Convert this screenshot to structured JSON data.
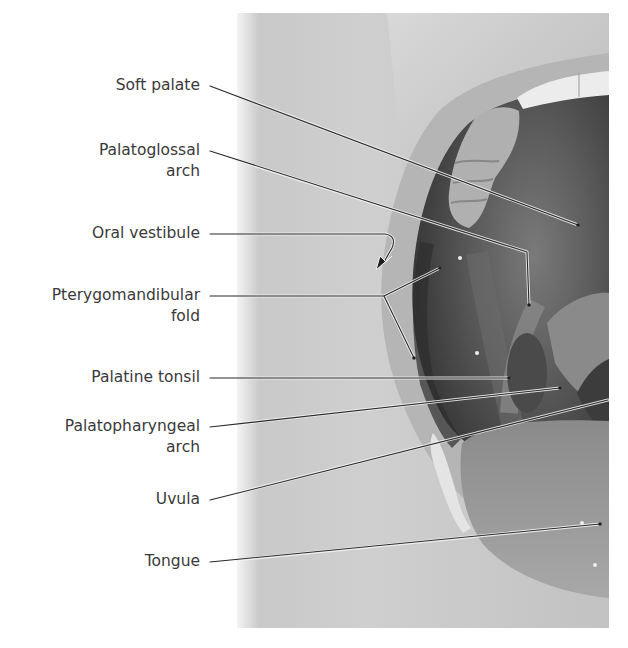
{
  "figure": {
    "type": "labeled anatomical photograph",
    "colors": {
      "text": "#3a3a3a",
      "leader_dark": "#2a2a2a",
      "leader_light": "#f2f2f2",
      "background": "#ffffff"
    }
  },
  "labels": [
    {
      "id": "soft-palate",
      "lines": [
        "Soft palate"
      ],
      "top": 75
    },
    {
      "id": "palatoglossal-arch",
      "lines": [
        "Palatoglossal",
        "arch"
      ],
      "top": 140
    },
    {
      "id": "oral-vestibule",
      "lines": [
        "Oral vestibule"
      ],
      "top": 223
    },
    {
      "id": "pterygomandibular-fold",
      "lines": [
        "Pterygomandibular",
        "fold"
      ],
      "top": 285
    },
    {
      "id": "palatine-tonsil",
      "lines": [
        "Palatine tonsil"
      ],
      "top": 367
    },
    {
      "id": "palatopharyngeal-arch",
      "lines": [
        "Palatopharyngeal",
        "arch"
      ],
      "top": 416
    },
    {
      "id": "uvula",
      "lines": [
        "Uvula"
      ],
      "top": 489
    },
    {
      "id": "tongue",
      "lines": [
        "Tongue"
      ],
      "top": 551
    }
  ],
  "leaders": [
    {
      "id": "soft-palate",
      "points": [
        [
          210,
          86
        ],
        [
          578,
          225
        ]
      ],
      "dot": true
    },
    {
      "id": "palatoglossal-arch",
      "points": [
        [
          210,
          151
        ],
        [
          527,
          252
        ],
        [
          529,
          305
        ]
      ],
      "dot": true
    },
    {
      "id": "oral-vestibule",
      "points": [
        [
          210,
          234
        ],
        [
          391,
          234
        ]
      ],
      "arrow": true
    },
    {
      "id": "pterygomandibular-fold",
      "points": [
        [
          210,
          296
        ],
        [
          384,
          296
        ]
      ],
      "branches": [
        [
          [
            384,
            296
          ],
          [
            440,
            268
          ]
        ],
        [
          [
            384,
            296
          ],
          [
            414,
            358
          ]
        ]
      ],
      "dot": true
    },
    {
      "id": "palatine-tonsil",
      "points": [
        [
          210,
          378
        ],
        [
          509,
          378
        ]
      ],
      "dot": true
    },
    {
      "id": "palatopharyngeal-arch",
      "points": [
        [
          210,
          427
        ],
        [
          560,
          388
        ]
      ],
      "dot": true
    },
    {
      "id": "uvula",
      "points": [
        [
          210,
          500
        ],
        [
          608,
          400
        ]
      ],
      "dot": false
    },
    {
      "id": "tongue",
      "points": [
        [
          210,
          562
        ],
        [
          600,
          524
        ]
      ],
      "dot": true
    }
  ]
}
